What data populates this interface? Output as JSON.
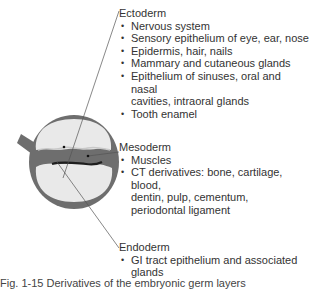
{
  "diagram": {
    "colors": {
      "tissue": "#6e6e6e",
      "cavity": "#e9e9e9",
      "leader_line": "#555555",
      "text": "#333333"
    }
  },
  "groups": {
    "ectoderm": {
      "title": "Ectoderm",
      "items": [
        "Nervous system",
        "Sensory epithelium of eye, ear, nose",
        "Epidermis, hair, nails",
        "Mammary and cutaneous glands",
        "Epithelium of sinuses, oral and nasal\ncavities, intraoral glands",
        "Tooth enamel"
      ]
    },
    "mesoderm": {
      "title": "Mesoderm",
      "items": [
        "Muscles",
        "CT derivatives: bone, cartilage, blood,\ndentin, pulp, cementum,\nperiodontal ligament"
      ]
    },
    "endoderm": {
      "title": "Endoderm",
      "items": [
        "GI tract epithelium and associated\nglands"
      ]
    }
  },
  "bullet": "•",
  "caption": "Fig. 1-15  Derivatives of the embryonic germ layers"
}
